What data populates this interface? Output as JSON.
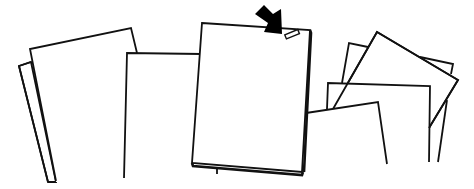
{
  "illustration": {
    "title": "Stack of loose paper sheets with one highlighted document",
    "description": "Line drawing of several scattered sheets of paper; the central sheet has a small tab/clip at its top-right corner indicated by a black arrow",
    "colors": {
      "background": "#ffffff",
      "stroke": "#111111",
      "arrow": "#000000"
    },
    "elements": {
      "left_group": "two overlapping tilted sheets",
      "middle_left": "upright sheet behind center document",
      "center_document": "highlighted sheet with thickness at base",
      "indicator_arrow": "black arrow pointing down-right",
      "tab": "small rectangular tab at top-right of center document",
      "right_group": "several overlapping tilted sheets"
    }
  }
}
